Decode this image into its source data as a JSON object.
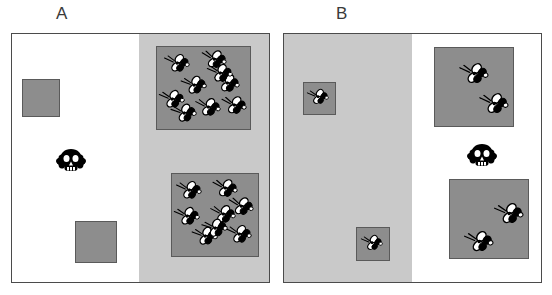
{
  "figure": {
    "title": "",
    "background_color": "#ffffff",
    "width": 552,
    "height": 295
  },
  "colors": {
    "arena_border": "#4b4b4b",
    "arena_background": "#ffffff",
    "shaded_half": "#c9c9c9",
    "patch_fill": "#8d8d8d",
    "patch_border": "#5a5a5a",
    "fly_body": "#000000",
    "fly_wing": "#ffffff",
    "skull": "#000000",
    "label_text": "#3a3a3a"
  },
  "panels": [
    {
      "id": "A",
      "label": "A",
      "label_x": 56,
      "label_y": 4,
      "arena": {
        "x": 11,
        "y": 33,
        "w": 259,
        "h": 250
      },
      "shade": {
        "side": "right",
        "x": 127,
        "w": 132,
        "color": "#c9c9c9",
        "description": "shaded half on the right side"
      },
      "skull": {
        "x": 55,
        "y": 147,
        "w": 34,
        "h": 30
      },
      "patches": [
        {
          "name": "empty-patch-upper-left",
          "x": 23,
          "y": 80,
          "w": 38,
          "h": 38,
          "fly_count": 0,
          "in_shade": false,
          "flies": []
        },
        {
          "name": "empty-patch-lower-left",
          "x": 76,
          "y": 222,
          "w": 42,
          "h": 42,
          "fly_count": 0,
          "in_shade": false,
          "flies": []
        },
        {
          "name": "fly-patch-upper-right",
          "x": 157,
          "y": 47,
          "w": 95,
          "h": 84,
          "fly_count": 9,
          "in_shade": true,
          "flies": [
            {
              "x": 7,
              "y": 6,
              "rot": -18,
              "size": "normal"
            },
            {
              "x": 44,
              "y": 2,
              "rot": -12,
              "size": "normal"
            },
            {
              "x": 24,
              "y": 28,
              "rot": -22,
              "size": "normal"
            },
            {
              "x": 57,
              "y": 26,
              "rot": -15,
              "size": "normal"
            },
            {
              "x": 2,
              "y": 42,
              "rot": -20,
              "size": "normal"
            },
            {
              "x": 38,
              "y": 50,
              "rot": -16,
              "size": "normal"
            },
            {
              "x": 64,
              "y": 48,
              "rot": -14,
              "size": "normal"
            },
            {
              "x": 14,
              "y": 56,
              "rot": -24,
              "size": "normal"
            },
            {
              "x": 50,
              "y": 16,
              "rot": -20,
              "size": "normal"
            }
          ]
        },
        {
          "name": "fly-patch-lower-right",
          "x": 172,
          "y": 174,
          "w": 88,
          "h": 84,
          "fly_count": 8,
          "in_shade": true,
          "flies": [
            {
              "x": 4,
              "y": 6,
              "rot": -18,
              "size": "normal"
            },
            {
              "x": 40,
              "y": 4,
              "rot": -14,
              "size": "normal"
            },
            {
              "x": 2,
              "y": 32,
              "rot": -20,
              "size": "normal"
            },
            {
              "x": 38,
              "y": 30,
              "rot": -16,
              "size": "normal"
            },
            {
              "x": 20,
              "y": 52,
              "rot": -22,
              "size": "normal"
            },
            {
              "x": 54,
              "y": 50,
              "rot": -18,
              "size": "normal"
            },
            {
              "x": 56,
              "y": 22,
              "rot": -12,
              "size": "normal"
            },
            {
              "x": 30,
              "y": 44,
              "rot": -26,
              "size": "normal"
            }
          ]
        }
      ]
    },
    {
      "id": "B",
      "label": "B",
      "label_x": 336,
      "label_y": 4,
      "arena": {
        "x": 283,
        "y": 33,
        "w": 259,
        "h": 250
      },
      "shade": {
        "side": "left",
        "x": 0,
        "w": 128,
        "color": "#c9c9c9",
        "description": "shaded half on the left side"
      },
      "skull": {
        "x": 466,
        "y": 142,
        "w": 34,
        "h": 30
      },
      "patches": [
        {
          "name": "fly-patch-small-upper-left",
          "x": 304,
          "y": 83,
          "w": 33,
          "h": 33,
          "fly_count": 1,
          "in_shade": true,
          "flies": [
            {
              "x": 3,
              "y": 5,
              "rot": -20,
              "size": "small"
            }
          ]
        },
        {
          "name": "fly-patch-small-lower-left",
          "x": 357,
          "y": 228,
          "w": 34,
          "h": 34,
          "fly_count": 1,
          "in_shade": true,
          "flies": [
            {
              "x": 4,
              "y": 6,
              "rot": -20,
              "size": "small"
            }
          ]
        },
        {
          "name": "fly-patch-upper-right",
          "x": 435,
          "y": 48,
          "w": 80,
          "h": 80,
          "fly_count": 2,
          "in_shade": false,
          "flies": [
            {
              "x": 24,
              "y": 14,
              "rot": -18,
              "size": "big"
            },
            {
              "x": 44,
              "y": 44,
              "rot": -18,
              "size": "big"
            }
          ]
        },
        {
          "name": "fly-patch-lower-right",
          "x": 450,
          "y": 180,
          "w": 80,
          "h": 80,
          "fly_count": 2,
          "in_shade": false,
          "flies": [
            {
              "x": 44,
              "y": 22,
              "rot": -20,
              "size": "big"
            },
            {
              "x": 14,
              "y": 50,
              "rot": -20,
              "size": "big"
            }
          ]
        }
      ]
    }
  ],
  "icons": {
    "fly": "fly-icon",
    "skull": "skull-and-crossbones-icon",
    "patch": "resource-patch"
  }
}
